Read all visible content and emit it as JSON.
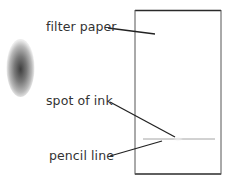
{
  "diagram": {
    "type": "chromatography-setup",
    "labels": {
      "filter_paper": "filter paper",
      "spot_of_ink": "spot of ink",
      "pencil_line": "pencil line"
    },
    "colors": {
      "paper_border": "#2a2a2a",
      "leader_line": "#222222",
      "pencil_line": "#9a9a9a",
      "ink_spot_core": "#4a4a4a",
      "text": "#333333"
    }
  }
}
